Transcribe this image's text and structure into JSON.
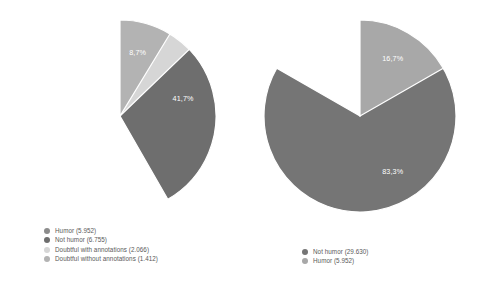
{
  "chart_data": [
    {
      "type": "pie",
      "name": "left-pie",
      "title": "",
      "legend_position": "bottom-left",
      "start_angle_deg": 0,
      "direction": "clockwise",
      "categories": [
        "Humor (5.952)",
        "Not humor (6.755)",
        "Doubtful with annotations (2.066)",
        "Doubtful without annotations (1.412)"
      ],
      "values": [
        5952,
        6755,
        2066,
        1412
      ],
      "percent_labels": [
        "36,8%",
        "41,7%",
        "12,8%",
        "8,7%"
      ],
      "percents": [
        36.8,
        41.7,
        12.8,
        8.7
      ],
      "colors": [
        "#8c8c8c",
        "#6e6e6e",
        "#d6d6d6",
        "#b3b3b3"
      ],
      "label_color": "#ffffff",
      "slice_gap_color": "#ffffff"
    },
    {
      "type": "pie",
      "name": "right-pie",
      "title": "",
      "legend_position": "bottom-center",
      "start_angle_deg": 0,
      "direction": "clockwise",
      "categories": [
        "Not humor (29.630)",
        "Humor (5.952)"
      ],
      "values": [
        29630,
        5952
      ],
      "percent_labels": [
        "83,3%",
        "16,7%"
      ],
      "percents": [
        83.3,
        16.7
      ],
      "colors": [
        "#757575",
        "#a8a8a8"
      ],
      "label_color": "#ffffff",
      "slice_gap_color": "#ffffff"
    }
  ],
  "left": {
    "slices": [
      {
        "label": "36,8%",
        "color": "#8c8c8c"
      },
      {
        "label": "41,7%",
        "color": "#6e6e6e"
      },
      {
        "label": "12,8%",
        "color": "#d6d6d6"
      },
      {
        "label": "8,7%",
        "color": "#b3b3b3"
      }
    ],
    "legend": [
      {
        "text": "Humor (5.952)",
        "color": "#8c8c8c"
      },
      {
        "text": "Not humor (6.755)",
        "color": "#6e6e6e"
      },
      {
        "text": "Doubtful with annotations (2.066)",
        "color": "#d6d6d6"
      },
      {
        "text": "Doubtful without annotations (1.412)",
        "color": "#b3b3b3"
      }
    ]
  },
  "right": {
    "slices": [
      {
        "label": "83,3%",
        "color": "#757575"
      },
      {
        "label": "16,7%",
        "color": "#a8a8a8"
      }
    ],
    "legend": [
      {
        "text": "Not humor (29.630)",
        "color": "#757575"
      },
      {
        "text": "Humor (5.952)",
        "color": "#a8a8a8"
      }
    ]
  }
}
